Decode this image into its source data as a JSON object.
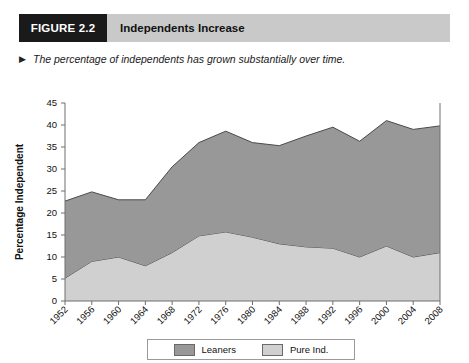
{
  "figure": {
    "number_label": "FIGURE 2.2",
    "title": "Independents Increase",
    "caption_marker": "▶",
    "caption": "The percentage of independents has grown substantially over time."
  },
  "colors": {
    "leaners_fill": "#989898",
    "pure_ind_fill": "#d0d0d0",
    "series_stroke": "#4a4a4a",
    "axis": "#6e6e6e",
    "header_bar": "#c9c9c9",
    "header_block": "#1a1a1a",
    "text": "#111111",
    "plot_background": "#ffffff"
  },
  "chart_data": {
    "type": "area",
    "stacked": true,
    "title": "Independents Increase",
    "xlabel": "",
    "ylabel": "Percentage Independent",
    "ylim": [
      0,
      45
    ],
    "ytick_step": 5,
    "yticks": [
      0,
      5,
      10,
      15,
      20,
      25,
      30,
      35,
      40,
      45
    ],
    "grid": false,
    "legend_position": "bottom",
    "categories": [
      "1952",
      "1956",
      "1960",
      "1964",
      "1968",
      "1972",
      "1976",
      "1980",
      "1984",
      "1988",
      "1992",
      "1996",
      "2000",
      "2004",
      "2008"
    ],
    "series": [
      {
        "name": "Pure Ind.",
        "fill": "#d0d0d0",
        "values": [
          5.2,
          9.0,
          10.0,
          8.0,
          11.0,
          14.8,
          15.7,
          14.5,
          13.0,
          12.3,
          12.0,
          10.0,
          12.5,
          10.0,
          11.0
        ]
      },
      {
        "name": "Leaners",
        "fill": "#989898",
        "values": [
          17.5,
          15.8,
          13.0,
          15.0,
          19.5,
          21.2,
          22.9,
          21.5,
          22.3,
          25.2,
          27.5,
          26.3,
          28.5,
          29.0,
          28.8
        ]
      }
    ],
    "totals": [
      22.7,
      24.8,
      23.0,
      23.0,
      30.5,
      36.0,
      38.6,
      36.0,
      35.3,
      37.5,
      39.5,
      36.3,
      41.0,
      39.0,
      39.8
    ]
  },
  "legend": {
    "entries": [
      {
        "label": "Leaners",
        "color": "#989898"
      },
      {
        "label": "Pure Ind.",
        "color": "#d0d0d0"
      }
    ]
  }
}
